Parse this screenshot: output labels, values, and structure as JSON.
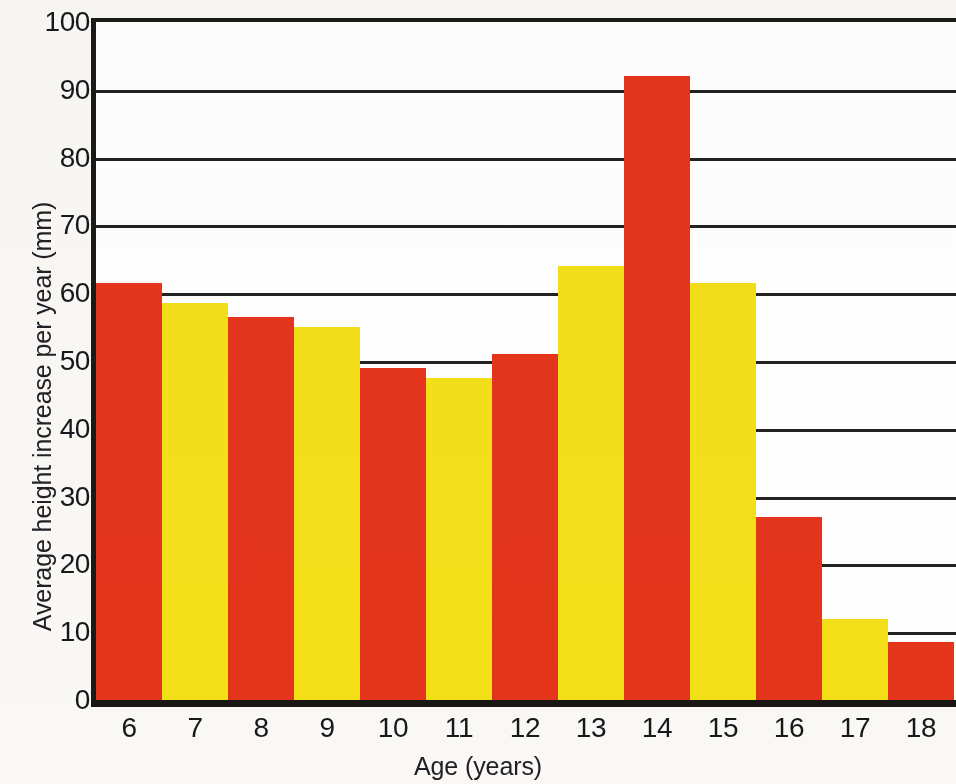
{
  "chart_data": {
    "type": "bar",
    "title": "",
    "xlabel": "Age (years)",
    "ylabel": "Average height increase per year (mm)",
    "categories": [
      "6",
      "7",
      "8",
      "9",
      "10",
      "11",
      "12",
      "13",
      "14",
      "15",
      "16",
      "17",
      "18"
    ],
    "values": [
      61.5,
      58.5,
      56.5,
      55,
      49,
      47.5,
      51,
      64,
      92,
      61.5,
      27,
      12,
      8.5
    ],
    "bar_colors": [
      "red",
      "yellow",
      "red",
      "yellow",
      "red",
      "yellow",
      "red",
      "yellow",
      "red",
      "yellow",
      "red",
      "yellow",
      "red"
    ],
    "colors": {
      "red": "#e4351b",
      "yellow": "#f3e019",
      "axis": "#1b1a18",
      "gridline": "#24221f",
      "plot_background": "#ffffff",
      "page_background": "#f9f8f4",
      "text": "#18171c"
    },
    "ylim": [
      0,
      100
    ],
    "y_ticks": [
      0,
      10,
      20,
      30,
      40,
      50,
      60,
      70,
      80,
      90,
      100
    ],
    "y_tick_labels": [
      "0",
      "10",
      "20",
      "30",
      "40",
      "50",
      "60",
      "70",
      "80",
      "90",
      "100"
    ],
    "grid": true,
    "grid_axis": "y",
    "legend": null,
    "legend_position": "none"
  },
  "axes": {
    "y_title": "Average height increase per year (mm)",
    "x_title": "Age (years)"
  }
}
